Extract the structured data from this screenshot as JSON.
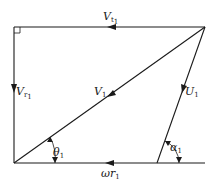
{
  "diagram": {
    "type": "velocity-triangle",
    "colors": {
      "line": "#1a1a1a",
      "background": "#ffffff"
    },
    "vectors": [
      {
        "id": "tangential",
        "label": "V",
        "subscript": "t1",
        "from": [
          205,
          27
        ],
        "to": [
          14,
          27
        ],
        "arrow_at": [
          112,
          27
        ]
      },
      {
        "id": "radial",
        "label": "V",
        "subscript": "r1",
        "from": [
          14,
          27
        ],
        "to": [
          14,
          163
        ],
        "arrow_at": [
          14,
          90
        ]
      },
      {
        "id": "absolute",
        "label": "V",
        "subscript": "1",
        "from": [
          205,
          27
        ],
        "to": [
          14,
          163
        ],
        "arrow_at": [
          110,
          95
        ]
      },
      {
        "id": "relative",
        "label": "U",
        "subscript": "1",
        "from": [
          205,
          27
        ],
        "to": [
          157,
          163
        ],
        "arrow_at": [
          183,
          90
        ]
      },
      {
        "id": "blade-speed",
        "label": "ωr",
        "subscript": "1",
        "from": [
          205,
          163
        ],
        "to": [
          14,
          163
        ],
        "arrow_at": [
          110,
          163
        ]
      }
    ],
    "angles": [
      {
        "id": "theta",
        "label": "θ",
        "subscript": "1"
      },
      {
        "id": "alpha",
        "label": "α",
        "subscript": "1"
      }
    ],
    "labels": {
      "vt": {
        "main": "V",
        "sub": "t",
        "sub2": "1"
      },
      "vr": {
        "main": "V",
        "sub": "r",
        "sub2": "1"
      },
      "v1": {
        "main": "V",
        "sub": "1"
      },
      "u1": {
        "main": "U",
        "sub": "1"
      },
      "wr": {
        "main": "ωr",
        "sub": "1"
      },
      "theta": {
        "main": "θ",
        "sub": "1"
      },
      "alpha": {
        "main": "α",
        "sub": "1"
      }
    },
    "right_angle_marker": "top-left"
  }
}
